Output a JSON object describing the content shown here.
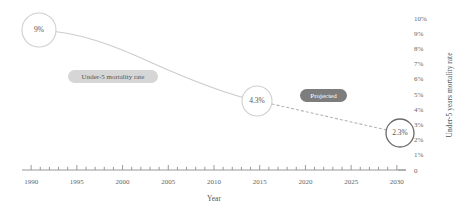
{
  "chart_data": {
    "type": "line",
    "title": "",
    "xlabel": "Year",
    "ylabel": "Under-5 years mortality rate",
    "xlim": [
      1989,
      2031
    ],
    "ylim": [
      0,
      10
    ],
    "grid": false,
    "legend_position": "inline-annotation",
    "x_tick_labels": [
      "1990",
      "1995",
      "2000",
      "2005",
      "2010",
      "2015",
      "2020",
      "2025",
      "2030"
    ],
    "x_tick_values": [
      1990,
      1995,
      2000,
      2005,
      2010,
      2015,
      2020,
      2025,
      2030
    ],
    "y_tick_labels": [
      "10%",
      "9%",
      "8%",
      "7%",
      "6%",
      "5%",
      "4%",
      "3%",
      "2%",
      "1%",
      "0"
    ],
    "y_tick_values": [
      10,
      9,
      8,
      7,
      6,
      5,
      4,
      3,
      2,
      1,
      0
    ],
    "series": [
      {
        "name": "Under-5 mortality rate",
        "style": "solid",
        "color": "#c9c9c9",
        "x": [
          1990,
          1995,
          2000,
          2005,
          2010,
          2015
        ],
        "values": [
          9.0,
          8.4,
          7.5,
          6.4,
          5.3,
          4.3
        ]
      },
      {
        "name": "Projected",
        "style": "dotted",
        "color": "#b0b0b0",
        "x": [
          2015,
          2020,
          2025,
          2030
        ],
        "values": [
          4.3,
          3.6,
          2.9,
          2.3
        ]
      }
    ],
    "markers": [
      {
        "name": "marker-1990",
        "x": 1990,
        "value": 9.0,
        "label": "9%",
        "emphasis": "light"
      },
      {
        "name": "marker-2015",
        "x": 2015,
        "value": 4.3,
        "label": "4.3%",
        "emphasis": "light"
      },
      {
        "name": "marker-2030",
        "x": 2030,
        "value": 2.3,
        "label": "2.3%",
        "emphasis": "strong"
      }
    ],
    "annotations": [
      {
        "name": "series-badge-actual",
        "text": "Under-5 mortality rate",
        "style": "light-pill",
        "bg": "#d4d4d4",
        "fg": "#555555"
      },
      {
        "name": "series-badge-projected",
        "text": "Projected",
        "style": "dark-pill",
        "bg": "#7a7a7a",
        "fg": "#ffffff"
      }
    ],
    "colors": {
      "line": "#c9c9c9",
      "projected_line": "#b0b0b0",
      "marker_stroke": "#c0c0c0",
      "marker_stroke_strong": "#555555",
      "axis": "#888888",
      "text": "#555555",
      "background": "#ffffff"
    }
  }
}
